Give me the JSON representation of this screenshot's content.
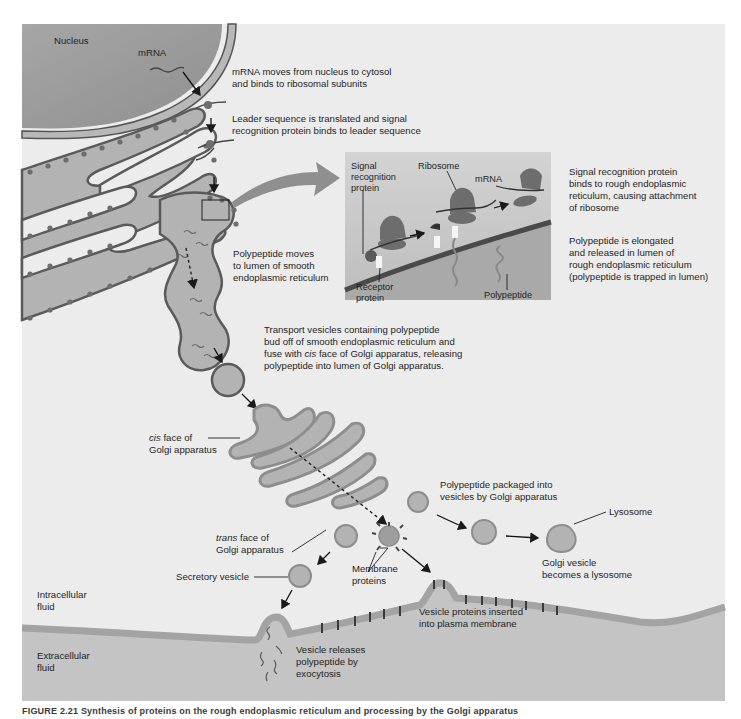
{
  "figure": {
    "colors": {
      "panel_bg": "#ececec",
      "cytoplasm_bg": "#eeeeee",
      "nucleus_fill": "#9e9e9e",
      "nucleus_membrane": "#b8b8b8",
      "er_fill": "#b3b3b3",
      "er_membrane": "#5a5a5a",
      "ribosome": "#6d6d6d",
      "inset_bg": "#c9c9c9",
      "extracellular_fill": "#c4c4c4",
      "plasma_membrane": "#a3a3a3",
      "arrow": "#1a1a1a",
      "big_arrow": "#8f8f8f"
    },
    "labels": {
      "nucleus": "Nucleus",
      "mrna": "mRNA",
      "step1_line1": "mRNA moves from nucleus to cytosol",
      "step1_line2": "and binds to ribosomal subunits",
      "step2_line1": "Leader sequence is translated and signal",
      "step2_line2": "recognition protein binds to leader sequence",
      "polypeptide_moves_1": "Polypeptide moves",
      "polypeptide_moves_2": "to lumen of smooth",
      "polypeptide_moves_3": "endoplasmic reticulum",
      "transport_1": "Transport vesicles containing polypeptide",
      "transport_2": "bud off of smooth endoplasmic reticulum and",
      "transport_3a": "fuse with ",
      "transport_3b": "cis",
      "transport_3c": " face of Golgi apparatus, releasing",
      "transport_4": "polypeptide into lumen of Golgi apparatus.",
      "cis_1a": "cis",
      "cis_1b": " face of",
      "cis_2": "Golgi apparatus",
      "trans_1a": "trans",
      "trans_1b": " face of",
      "trans_2": "Golgi apparatus",
      "secretory_vesicle": "Secretory vesicle",
      "membrane_proteins_1": "Membrane",
      "membrane_proteins_2": "proteins",
      "packaged_1": "Polypeptide packaged into",
      "packaged_2": "vesicles by Golgi apparatus",
      "lysosome": "Lysosome",
      "golgi_vesicle_1": "Golgi vesicle",
      "golgi_vesicle_2": "becomes a lysosome",
      "intracellular_1": "Intracellular",
      "intracellular_2": "fluid",
      "extracellular_1": "Extracellular",
      "extracellular_2": "fluid",
      "vesicle_proteins_1": "Vesicle proteins inserted",
      "vesicle_proteins_2": "into plasma membrane",
      "exocytosis_1": "Vesicle releases",
      "exocytosis_2": "polypeptide by",
      "exocytosis_3": "exocytosis"
    },
    "inset": {
      "srp_1": "Signal",
      "srp_2": "recognition",
      "srp_3": "protein",
      "ribosome": "Ribosome",
      "mrna": "mRNA",
      "receptor_1": "Receptor",
      "receptor_2": "protein",
      "polypeptide": "Polypeptide"
    },
    "side_notes": {
      "srp_binds_1": "Signal recognition protein",
      "srp_binds_2": "binds to rough endoplasmic",
      "srp_binds_3": "reticulum, causing attachment",
      "srp_binds_4": "of ribosome",
      "elongated_1": "Polypeptide is elongated",
      "elongated_2": "and released in lumen of",
      "elongated_3": "rough endoplasmic reticulum",
      "elongated_4": "(polypeptide is trapped in lumen)"
    },
    "caption": "FIGURE 2.21  Synthesis of proteins on the rough endoplasmic reticulum and processing by the Golgi apparatus"
  }
}
